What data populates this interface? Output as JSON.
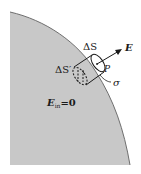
{
  "diagram": {
    "type": "gauss-pillbox-conductor-surface",
    "colors": {
      "conductor_fill": "#c8c8c8",
      "boundary": "#6e6e6e",
      "ink": "#1a1a1a",
      "background": "#ffffff"
    },
    "labels": {
      "outer_face": "ΔS",
      "inner_face": "ΔS′",
      "field": "E",
      "point": "P",
      "surface_charge": "σ",
      "inside_field_E": "E",
      "inside_field_sub": "in",
      "inside_field_eq": "=0"
    }
  }
}
